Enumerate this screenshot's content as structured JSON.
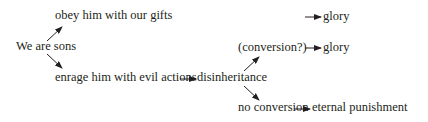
{
  "diagram": {
    "nodes": {
      "root": "We are sons",
      "obey": "obey him with our gifts",
      "enrage": "enrage him with evil actions",
      "disinheritance": "disinheritance",
      "conversion": "(conversion?)",
      "no_conversion": "no conversion",
      "glory_top": "glory",
      "glory_mid": "glory",
      "eternal_punishment": "eternal punishment"
    },
    "edges": [
      {
        "from": "We are sons",
        "to": "obey him with our gifts"
      },
      {
        "from": "We are sons",
        "to": "enrage him with evil actions"
      },
      {
        "from": "obey him with our gifts",
        "to": "glory"
      },
      {
        "from": "enrage him with evil actions",
        "to": "disinheritance"
      },
      {
        "from": "disinheritance",
        "to": "(conversion?)"
      },
      {
        "from": "disinheritance",
        "to": "no conversion"
      },
      {
        "from": "(conversion?)",
        "to": "glory"
      },
      {
        "from": "no conversion",
        "to": "eternal punishment"
      }
    ],
    "colors": {
      "text": "#231f20",
      "arrow": "#231f20",
      "background": "#ffffff"
    }
  }
}
